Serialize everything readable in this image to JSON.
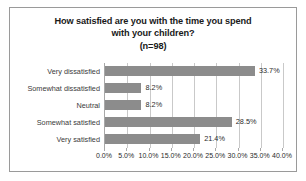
{
  "chart_data": {
    "type": "bar",
    "orientation": "horizontal",
    "title": "How satisfied are you with the time you spend with your children? (n=98)",
    "title_lines": [
      "How satisfied are you with the time you spend",
      "with your children?",
      "(n=98)"
    ],
    "categories": [
      "Very dissatisfied",
      "Somewhat dissatisfied",
      "Neutral",
      "Somewhat satisfied",
      "Very satisfied"
    ],
    "values": [
      33.7,
      8.2,
      8.2,
      28.5,
      21.4
    ],
    "value_labels": [
      "33.7%",
      "8.2%",
      "8.2%",
      "28.5%",
      "21.4%"
    ],
    "xlabel": "",
    "ylabel": "",
    "xlim": [
      0,
      40
    ],
    "xticks": [
      0,
      5,
      10,
      15,
      20,
      25,
      30,
      35,
      40
    ],
    "xtick_labels": [
      "0.0%",
      "5.0%",
      "10.0%",
      "15.0%",
      "20.0%",
      "25.0%",
      "30.0%",
      "35.0%",
      "40.0%"
    ],
    "grid": true,
    "legend": false,
    "sample_size": 98,
    "bar_color": "#8c8c8c",
    "gridline_color": "#c9c9c9",
    "border_color": "#9a9a9a"
  }
}
